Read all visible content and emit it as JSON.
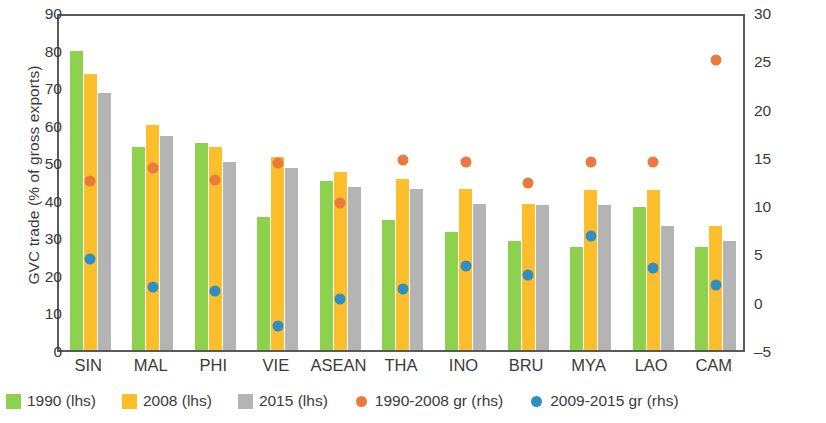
{
  "chart_data": {
    "type": "bar",
    "title": "",
    "subtitle": "",
    "xlabel": "",
    "ylabel": "GVC trade (% of gross exports)",
    "ylabel_right": "average growth rate (%)",
    "categories": [
      "SIN",
      "MAL",
      "PHI",
      "VIE",
      "ASEAN",
      "THA",
      "INO",
      "BRU",
      "MYA",
      "LAO",
      "CAM"
    ],
    "ylim": [
      0,
      90
    ],
    "yticks": [
      0,
      10,
      20,
      30,
      40,
      50,
      60,
      70,
      80,
      90
    ],
    "ylim_right": [
      -5,
      30
    ],
    "yticks_right": [
      -5,
      0,
      5,
      10,
      15,
      20,
      25,
      30
    ],
    "grid": false,
    "legend_position": "bottom",
    "series": [
      {
        "name": "1990 (lhs)",
        "type": "bar",
        "axis": "left",
        "color": "#8ed14f",
        "values": [
          79.5,
          54.0,
          55.0,
          35.5,
          45.0,
          34.5,
          31.5,
          29.0,
          27.5,
          38.0,
          27.5
        ]
      },
      {
        "name": "2008 (lhs)",
        "type": "bar",
        "axis": "left",
        "color": "#fcbe2b",
        "values": [
          73.5,
          60.0,
          54.0,
          51.5,
          47.5,
          45.5,
          43.0,
          39.0,
          42.5,
          42.5,
          33.0
        ]
      },
      {
        "name": "2015 (lhs)",
        "type": "bar",
        "axis": "left",
        "color": "#b4b4b4",
        "values": [
          68.5,
          57.0,
          50.0,
          48.5,
          43.5,
          43.0,
          39.0,
          38.5,
          38.5,
          33.0,
          29.0
        ]
      },
      {
        "name": "1990-2008 gr (rhs)",
        "type": "scatter",
        "axis": "right",
        "color": "#ec7a3c",
        "values": [
          13.1,
          14.4,
          13.2,
          14.9,
          10.8,
          15.2,
          15.0,
          12.9,
          15.0,
          15.0,
          25.6
        ]
      },
      {
        "name": "2009-2015 gr (rhs)",
        "type": "scatter",
        "axis": "right",
        "color": "#2e8fc4",
        "values": [
          5.0,
          2.1,
          1.7,
          -1.9,
          0.9,
          1.9,
          4.3,
          3.3,
          7.4,
          4.1,
          2.3
        ]
      }
    ]
  }
}
